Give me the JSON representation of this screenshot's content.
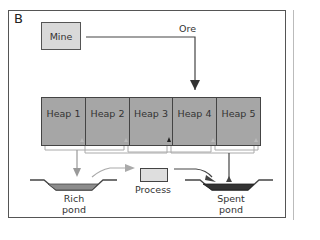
{
  "panel_label": "B",
  "nodes": {
    "mine": "Mine",
    "ore": "Ore",
    "heaps": [
      "Heap 1",
      "Heap 2",
      "Heap 3",
      "Heap 4",
      "Heap 5"
    ],
    "process": "Process",
    "rich_pond": {
      "line1": "Rich",
      "line2": "pond"
    },
    "spent_pond": {
      "line1": "Spent",
      "line2": "pond"
    }
  },
  "colors": {
    "mine_fill": "#d9d9d9",
    "heap_fill": "#a6a6a6",
    "rich_pond_fill": "#8c8c8c",
    "spent_pond_fill": "#333333",
    "process_fill": "#dedede",
    "flow_gray": "#999999",
    "flow_dark": "#444444"
  }
}
